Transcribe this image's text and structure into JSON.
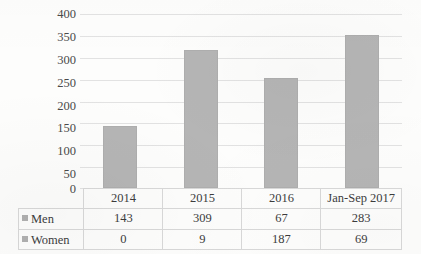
{
  "chart_data": {
    "type": "bar",
    "title": "",
    "subtitle": "",
    "xlabel": "",
    "ylabel": "",
    "categories": [
      "2014",
      "2015",
      "2016",
      "Jan-Sep 2017"
    ],
    "values": [
      143,
      318,
      254,
      352
    ],
    "value_note": "bar heights are the totals of Men + Women for each category",
    "series": [
      {
        "name": "Men",
        "values": [
          143,
          309,
          67,
          283
        ]
      },
      {
        "name": "Women",
        "values": [
          0,
          9,
          187,
          69
        ]
      }
    ],
    "ylim": [
      0,
      400
    ],
    "yticks": [
      0,
      50,
      100,
      150,
      200,
      250,
      300,
      350,
      400
    ],
    "ytick_labels": [
      "0",
      "50",
      "100",
      "150",
      "200",
      "250",
      "300",
      "350",
      "400"
    ],
    "grid": true,
    "legend_position": "data-table-left-column",
    "bar_color": "#b5b5b5",
    "gridline_color": "#e2e2e2",
    "has_data_table": true
  },
  "table": {
    "header_row": [
      "",
      "2014",
      "2015",
      "2016",
      "Jan-Sep 2017"
    ],
    "rows": [
      {
        "label": "Men",
        "swatch_color": "#b0b0b0",
        "cells": [
          "143",
          "309",
          "67",
          "283"
        ]
      },
      {
        "label": "Women",
        "swatch_color": "#b0b0b0",
        "cells": [
          "0",
          "9",
          "187",
          "69"
        ]
      }
    ]
  },
  "axis": {
    "ticks": [
      "400",
      "350",
      "300",
      "250",
      "200",
      "150",
      "100",
      "50",
      "0"
    ]
  }
}
